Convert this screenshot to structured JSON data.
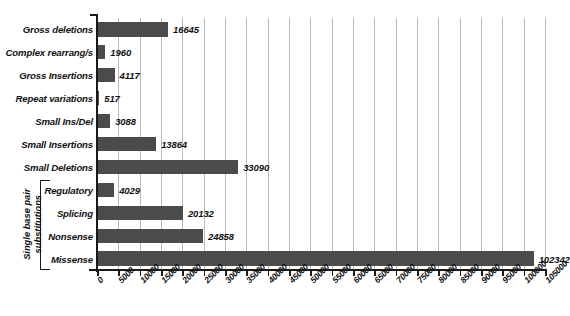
{
  "chart_data": {
    "type": "bar",
    "orientation": "horizontal",
    "title": "",
    "xlabel": "",
    "ylabel": "",
    "xlim": [
      0,
      105000
    ],
    "xtick_step": 5000,
    "grid": true,
    "legend": null,
    "bar_color": "#4b4b4b",
    "categories": [
      "Gross deletions",
      "Complex rearrang/s",
      "Gross Insertions",
      "Repeat variations",
      "Small Ins/Del",
      "Small Insertions",
      "Small Deletions",
      "Regulatory",
      "Splicing",
      "Nonsense",
      "Missense"
    ],
    "values": [
      16645,
      1960,
      4117,
      517,
      3088,
      13864,
      33090,
      4029,
      20132,
      24858,
      102342
    ],
    "value_labels": [
      "16645",
      "1960",
      "4117",
      "517",
      "3088",
      "13864",
      "33090",
      "4029",
      "20132",
      "24858",
      "102342"
    ],
    "xticks": [
      0,
      5000,
      10000,
      15000,
      20000,
      25000,
      30000,
      35000,
      40000,
      45000,
      50000,
      55000,
      60000,
      65000,
      70000,
      75000,
      80000,
      85000,
      90000,
      95000,
      100000,
      105000
    ],
    "xtick_labels": [
      "0",
      "5000",
      "10000",
      "15000",
      "20000",
      "25000",
      "30000",
      "35000",
      "40000",
      "45000",
      "50000",
      "55000",
      "60000",
      "65000",
      "70000",
      "75000",
      "80000",
      "85000",
      "90000",
      "95000",
      "100000",
      "105000"
    ],
    "group_annotation": {
      "label": "Single base pair substitutions",
      "label_line1": "Single base pair",
      "label_line2": "substitutions",
      "covers": [
        "Regulatory",
        "Splicing",
        "Nonsense",
        "Missense"
      ]
    }
  }
}
